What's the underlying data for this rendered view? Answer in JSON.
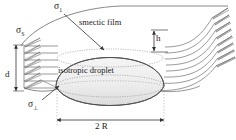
{
  "figure": {
    "canvas": {
      "width": 236,
      "height": 140,
      "background": "#ffffff"
    },
    "colors": {
      "stroke": "#4a4a4a",
      "stroke_dark": "#333333",
      "droplet_fill": "#e9e9e9",
      "droplet_shadow": "#d4d4d4",
      "film_fill": "#fbfbfb",
      "text": "#1a1a1a",
      "dotted": "#8c8c8c"
    }
  },
  "labels": {
    "sigma_s": {
      "symbol": "σ",
      "subscript": "S",
      "name": "surface-tension-film-air"
    },
    "sigma_i": {
      "symbol": "σ",
      "subscript": "1",
      "name": "surface-tension-isotropic"
    },
    "sigma_perp": {
      "symbol": "σ",
      "subscript": "⊥",
      "name": "surface-tension-perpendicular"
    },
    "smectic_film": "smectic film",
    "isotropic_droplet": "isotropic droplet",
    "height_h": "h",
    "thickness_d": "d",
    "diameter_2r": "2 R"
  },
  "geometry": {
    "droplet": {
      "center_x": 110,
      "center_y": 72,
      "half_width_2r": 55,
      "lens_top_y": 40,
      "lens_bottom_y": 108,
      "label_2r_value": "2 R"
    },
    "film": {
      "thickness_label": "d",
      "layer_count_left": 7,
      "layer_count_right": 8,
      "gap_label": "h"
    }
  },
  "annotations": {
    "leader_sigma_i": {
      "from_x": 66,
      "from_y": 14,
      "to_x": 104,
      "to_y": 48
    },
    "leader_sigma_perp": {
      "from_x": 42,
      "from_y": 100,
      "to_x": 58,
      "to_y": 86
    }
  }
}
